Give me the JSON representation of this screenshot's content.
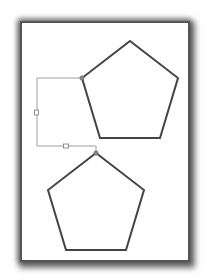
{
  "document": {
    "title": "",
    "shapes": [
      {
        "id": "pentagon-top",
        "type": "pentagon",
        "stroke": "#444444",
        "fill": "#ffffff"
      },
      {
        "id": "pentagon-bottom",
        "type": "pentagon",
        "stroke": "#444444",
        "fill": "#ffffff"
      }
    ],
    "connector": {
      "type": "elbow",
      "from": "pentagon-top",
      "to": "pentagon-bottom",
      "stroke": "#999999",
      "handle_count": 2,
      "endpoint_color": "#777777"
    }
  }
}
